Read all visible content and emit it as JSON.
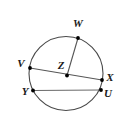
{
  "figure": {
    "kind": "circle-geometry-diagram",
    "canvas": {
      "width": 131,
      "height": 137
    },
    "background_color": "#ffffff",
    "stroke_color": "#4a4a4a",
    "chord_color": "#555555",
    "point_color": "#000000",
    "label_color": "#1a1a1a",
    "circle": {
      "cx": 66,
      "cy": 73.5,
      "r": 37
    },
    "points": [
      {
        "id": "W",
        "label": "W",
        "x": 78,
        "y": 38,
        "label_x": 78,
        "label_y": 27
      },
      {
        "id": "V",
        "label": "V",
        "x": 30,
        "y": 68,
        "label_x": 21,
        "label_y": 67
      },
      {
        "id": "Z",
        "label": "Z",
        "x": 67,
        "y": 75.5,
        "label_x": 61,
        "label_y": 69
      },
      {
        "id": "X",
        "label": "X",
        "x": 102,
        "y": 80,
        "label_x": 110,
        "label_y": 81
      },
      {
        "id": "Y",
        "label": "Y",
        "x": 33,
        "y": 90.5,
        "label_x": 25,
        "label_y": 95
      },
      {
        "id": "U",
        "label": "U",
        "x": 101,
        "y": 90,
        "label_x": 108,
        "label_y": 97
      }
    ],
    "segments": [
      {
        "id": "radius-ZW",
        "from": "Z",
        "to": "W"
      },
      {
        "id": "diameter-VX",
        "from": "V",
        "to": "X"
      },
      {
        "id": "chord-YU",
        "from": "Y",
        "to": "U"
      }
    ]
  }
}
